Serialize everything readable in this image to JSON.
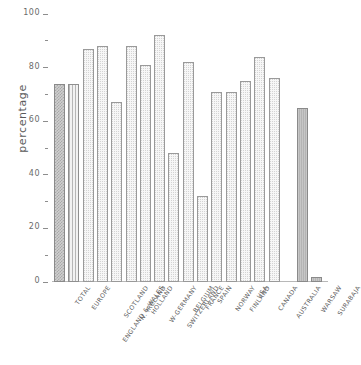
{
  "chart_data": {
    "type": "bar",
    "title": "",
    "subtitle": "",
    "xlabel": "",
    "ylabel": "percentage",
    "ylim": [
      0,
      100
    ],
    "grid": false,
    "legend": "none",
    "y_ticks_major": [
      0,
      20,
      40,
      60,
      80,
      100
    ],
    "y_ticks_minor": [
      10,
      30,
      50,
      70,
      90
    ],
    "categories": [
      "TOTAL",
      "EUROPE",
      "ENGLAND & WALES",
      "SCOTLAND",
      "N. IRELAND",
      "HOLLAND",
      "W-GERMANY",
      "SWITZERLAND",
      "BELGIUM",
      "FRANCE",
      "SPAIN",
      "NORWAY",
      "FINLAND",
      "USA",
      "CANADA",
      "AUSTRALIA",
      "WARSAW",
      "SURABAJA"
    ],
    "values": [
      74,
      74,
      87,
      88,
      67,
      88,
      81,
      92,
      48,
      82,
      32,
      71,
      71,
      75,
      84,
      76,
      65,
      2
    ],
    "bar_styles": [
      "checker",
      "vstripe",
      "dotted",
      "dotted",
      "dotted",
      "dotted",
      "dotted",
      "dotted",
      "dotted",
      "dotted",
      "dotted",
      "dotted",
      "dotted",
      "dotted",
      "dotted",
      "dotted",
      "solid",
      "solid"
    ],
    "group_break_after_index": 15,
    "colors": {
      "axis": "#b8b8b8",
      "tick": "#8d8d8d",
      "text": "#5f5f5f",
      "bar_outline": "#9a9a9a",
      "bar_light_fill": "#f7f7f7",
      "bar_dark_fill": "#b4b4b4"
    }
  }
}
